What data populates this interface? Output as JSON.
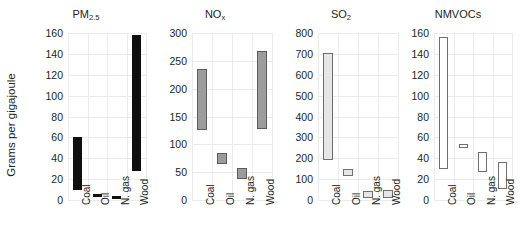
{
  "figure": {
    "ylabel": "Grams per gigajoule",
    "categories": [
      "Coal",
      "Oil",
      "N. gas",
      "Wood"
    ]
  },
  "chart_data": {
    "type": "bar",
    "title": "",
    "xlabel": "",
    "ylabel": "Grams per gigajoule",
    "grid": true,
    "legend": "none",
    "note": "Floating range bars: each bar spans a low-to-high emission factor range",
    "panels": [
      {
        "title": "PM2.5",
        "title_base": "PM",
        "title_sub": "2.5",
        "color": "#100f0f",
        "ylim": [
          0,
          160
        ],
        "yticks": [
          0,
          20,
          40,
          60,
          80,
          100,
          120,
          140,
          160
        ],
        "categories": [
          "Coal",
          "Oil",
          "N. gas",
          "Wood"
        ],
        "ranges": [
          [
            10,
            60
          ],
          [
            4,
            6
          ],
          [
            3,
            4
          ],
          [
            28,
            158
          ]
        ]
      },
      {
        "title": "NOx",
        "title_base": "NO",
        "title_sub": "x",
        "color": "#9c9c9c",
        "ylim": [
          0,
          300
        ],
        "yticks": [
          0,
          50,
          100,
          150,
          200,
          250,
          300
        ],
        "categories": [
          "Coal",
          "Oil",
          "N. gas",
          "Wood"
        ],
        "ranges": [
          [
            125,
            235
          ],
          [
            65,
            85
          ],
          [
            38,
            57
          ],
          [
            127,
            267
          ]
        ]
      },
      {
        "title": "SO2",
        "title_base": "SO",
        "title_sub": "2",
        "color": "#e6e6e6",
        "ylim": [
          0,
          800
        ],
        "yticks": [
          0,
          100,
          200,
          300,
          400,
          500,
          600,
          700,
          800
        ],
        "categories": [
          "Coal",
          "Oil",
          "N. gas",
          "Wood"
        ],
        "ranges": [
          [
            190,
            705
          ],
          [
            115,
            150
          ],
          [
            10,
            45
          ],
          [
            10,
            48
          ]
        ]
      },
      {
        "title": "NMVOCs",
        "title_base": "NMVOCs",
        "title_sub": "",
        "color": "#ffffff",
        "ylim": [
          0,
          160
        ],
        "yticks": [
          0,
          20,
          40,
          60,
          80,
          100,
          120,
          140,
          160
        ],
        "categories": [
          "Coal",
          "Oil",
          "N. gas",
          "Wood"
        ],
        "ranges": [
          [
            30,
            156
          ],
          [
            50,
            54
          ],
          [
            27,
            46
          ],
          [
            11,
            36
          ]
        ]
      }
    ]
  }
}
